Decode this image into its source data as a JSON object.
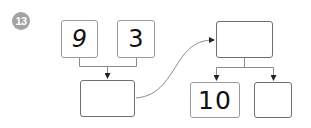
{
  "problem": {
    "number": "13",
    "badge_color": "#a3a3a3"
  },
  "diagram": {
    "top_left_inputs": [
      {
        "label": "9"
      },
      {
        "label": "3"
      }
    ],
    "left_result": {
      "label": ""
    },
    "right_top": {
      "label": ""
    },
    "right_outputs": [
      {
        "label": "10"
      },
      {
        "label": ""
      }
    ],
    "line_color": "#8a8a8a",
    "arrow_color": "#222222"
  }
}
